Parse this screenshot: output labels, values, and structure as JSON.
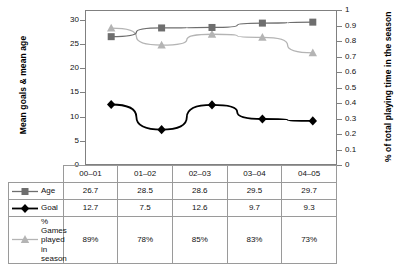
{
  "chart_data": {
    "type": "line",
    "title": "",
    "categories": [
      "00–01",
      "01–02",
      "02–03",
      "03–04",
      "04–05"
    ],
    "series": [
      {
        "name": "Age",
        "values": [
          26.7,
          28.5,
          28.6,
          29.5,
          29.7
        ],
        "axis": "left",
        "color": "#6e6e6e",
        "marker": "square"
      },
      {
        "name": "Goal",
        "values": [
          12.7,
          7.5,
          12.6,
          9.7,
          9.3
        ],
        "axis": "left",
        "color": "#000000",
        "marker": "diamond"
      },
      {
        "name": "% Games played in season",
        "values": [
          0.89,
          0.78,
          0.85,
          0.83,
          0.73
        ],
        "display_values": [
          "89%",
          "78%",
          "85%",
          "83%",
          "73%"
        ],
        "axis": "right",
        "color": "#b4b4b4",
        "marker": "triangle"
      }
    ],
    "ylabel": "Mean goals & mean age",
    "ylabel_right": "% of total playing time in the season",
    "xlabel": "",
    "ylim": [
      0,
      32
    ],
    "ylim_right": [
      0,
      1
    ],
    "yticks": [
      0,
      5,
      10,
      15,
      20,
      25,
      30
    ],
    "ytick_labels": [
      "0",
      "5",
      "10",
      "15",
      "20",
      "25",
      "30"
    ],
    "yticks_right": [
      0,
      0.1,
      0.2,
      0.3,
      0.4,
      0.5,
      0.6,
      0.7,
      0.8,
      0.9,
      1
    ],
    "ytick_labels_right": [
      "0",
      "0.1",
      "0.2",
      "0.3",
      "0.4",
      "0.5",
      "0.6",
      "0.7",
      "0.8",
      "0.9",
      "1"
    ],
    "grid": false,
    "legend_position": "data-table-left"
  },
  "table": {
    "columns": [
      "00–01",
      "01–02",
      "02–03",
      "03–04",
      "04–05"
    ],
    "rows": [
      {
        "label": "Age",
        "marker": "square-icon",
        "cells": [
          "26.7",
          "28.5",
          "28.6",
          "29.5",
          "29.7"
        ]
      },
      {
        "label": "Goal",
        "marker": "diamond-icon",
        "cells": [
          "12.7",
          "7.5",
          "12.6",
          "9.7",
          "9.3"
        ]
      },
      {
        "label": "% Games played in season",
        "marker": "triangle-icon",
        "cells": [
          "89%",
          "78%",
          "85%",
          "83%",
          "73%"
        ]
      }
    ]
  },
  "colors": {
    "age": "#6e6e6e",
    "goal": "#000000",
    "games": "#b4b4b4",
    "axis": "#808080",
    "border": "#9a9a9a"
  }
}
